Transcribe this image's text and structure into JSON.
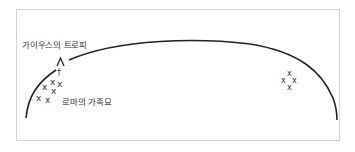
{
  "diagram": {
    "labels": {
      "trophy": "가이우스의 트로피",
      "tombs": "로마의 가족묘"
    },
    "markers": {
      "trophy_symbol": "Λ",
      "cross_symbol": "†",
      "grave_symbol": "x"
    },
    "colors": {
      "line": "#222222",
      "text": "#333333",
      "frame": "#d4d4d4"
    }
  }
}
